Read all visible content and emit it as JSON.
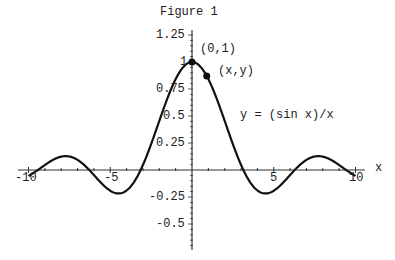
{
  "title": "Figure 1",
  "equation_label": "y = (sin x)/x",
  "point_labels": {
    "peak": "(0,1)",
    "general": "(x,y)"
  },
  "x_axis_label": "x",
  "x_tick_labels": [
    "-10",
    "-5",
    "5",
    "10"
  ],
  "y_tick_labels": [
    "1.25",
    "1",
    "0.75",
    "0.5",
    "0.25",
    "-0.25",
    "-0.5"
  ],
  "chart_data": {
    "type": "line",
    "title": "Figure 1",
    "xlabel": "x",
    "ylabel": "",
    "xlim": [
      -10.5,
      10.5
    ],
    "ylim": [
      -0.75,
      1.3
    ],
    "grid": false,
    "series": [
      {
        "name": "y = (sin x)/x",
        "function": "sin(x)/x",
        "x": [
          -10,
          -7.725,
          -6.283,
          -4.493,
          -3.142,
          0,
          3.142,
          4.493,
          6.283,
          7.725,
          10
        ],
        "values": [
          -0.054,
          0.128,
          0,
          -0.217,
          0,
          1,
          0,
          -0.217,
          0,
          0.128,
          -0.054
        ]
      }
    ],
    "points": [
      {
        "label": "(0,1)",
        "x": 0,
        "y": 1
      },
      {
        "label": "(x,y)",
        "x": 0.9,
        "y": 0.87
      }
    ],
    "x_ticks": [
      -10,
      -5,
      5,
      10
    ],
    "y_ticks": [
      -0.5,
      -0.25,
      0.25,
      0.5,
      0.75,
      1,
      1.25
    ]
  }
}
